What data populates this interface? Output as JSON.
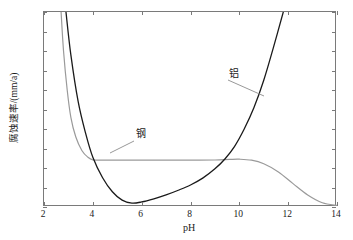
{
  "chart_data": {
    "type": "line",
    "title": "",
    "xlabel": "pH",
    "ylabel": "腐蚀速率/(mm/a)",
    "xlim": [
      2,
      14
    ],
    "ylim": [
      0,
      1
    ],
    "xticks": [
      "2",
      "4",
      "6",
      "8",
      "10",
      "12",
      "14"
    ],
    "yticks": [
      "0",
      "0.1",
      "0.2",
      "0.3",
      "0.4",
      "0.5",
      "0.6",
      "0.7",
      "0.8",
      "0.9",
      "1"
    ],
    "grid": false,
    "legend": "inline-callout-labels",
    "series": [
      {
        "name": "钢",
        "color": "#9a9a9a",
        "annotation": "钢",
        "x": [
          2.7,
          2.8,
          2.95,
          3.1,
          3.3,
          3.55,
          3.8,
          4.0,
          4.4,
          5.0,
          6.0,
          7.0,
          8.0,
          9.0,
          9.6,
          10.0,
          10.5,
          11.0,
          11.6,
          12.2,
          12.8,
          13.4,
          14.0
        ],
        "y": [
          1.0,
          0.8,
          0.6,
          0.46,
          0.36,
          0.29,
          0.255,
          0.242,
          0.24,
          0.24,
          0.24,
          0.24,
          0.24,
          0.241,
          0.244,
          0.245,
          0.24,
          0.222,
          0.18,
          0.12,
          0.062,
          0.022,
          0.008
        ]
      },
      {
        "name": "铝",
        "color": "#1a1a1a",
        "annotation": "铝",
        "x": [
          2.9,
          3.1,
          3.4,
          3.7,
          4.0,
          4.4,
          4.8,
          5.2,
          5.6,
          6.0,
          6.5,
          7.0,
          7.5,
          8.0,
          8.5,
          9.0,
          9.4,
          9.8,
          10.2,
          10.6,
          11.0,
          11.4,
          11.8
        ],
        "y": [
          1.0,
          0.78,
          0.54,
          0.38,
          0.255,
          0.15,
          0.078,
          0.035,
          0.02,
          0.026,
          0.042,
          0.062,
          0.086,
          0.113,
          0.148,
          0.196,
          0.245,
          0.31,
          0.4,
          0.51,
          0.65,
          0.82,
          1.0
        ]
      }
    ],
    "annotations": [
      {
        "text": "钢",
        "x_px": 136,
        "y_px": 128,
        "leader_from": [
          134,
          141
        ],
        "leader_to": [
          110,
          153
        ]
      },
      {
        "text": "铝",
        "x_px": 229,
        "y_px": 68,
        "leader_from": [
          228,
          80
        ],
        "leader_to": [
          264,
          96
        ]
      }
    ]
  }
}
